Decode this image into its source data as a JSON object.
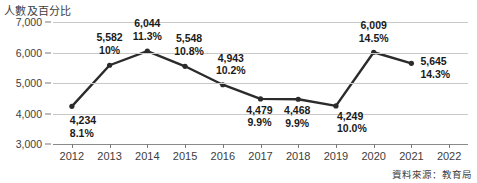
{
  "chart_data": {
    "type": "line",
    "title": "人數及百分比",
    "xlabel": "",
    "ylabel": "",
    "ylim": [
      3000,
      7000
    ],
    "y_step": 1000,
    "grid": true,
    "legend": null,
    "source_note": "資料來源：教育局",
    "line_color": "#2b2b2b",
    "grid_color": "#c9c9c9",
    "axis_color": "#8a8a8a",
    "text_color": "#3d3d3d",
    "categories": [
      "2012",
      "2013",
      "2014",
      "2015",
      "2016",
      "2017",
      "2018",
      "2019",
      "2020",
      "2021",
      "2022"
    ],
    "y_ticks": [
      "7,000",
      "6,000",
      "5,000",
      "4,000",
      "3,000"
    ],
    "y_tick_values": [
      7000,
      6000,
      5000,
      4000,
      3000
    ],
    "series": [
      {
        "name": "人數",
        "values": [
          4234,
          5582,
          6044,
          5548,
          4943,
          4479,
          4468,
          4249,
          6009,
          5645,
          null
        ]
      },
      {
        "name": "百分比",
        "values": [
          8.1,
          10,
          11.3,
          10.8,
          10.2,
          9.9,
          9.9,
          10.0,
          14.5,
          14.3,
          null
        ]
      }
    ],
    "point_labels": [
      {
        "year": "2012",
        "value": "4,234",
        "pct": "8.1%"
      },
      {
        "year": "2013",
        "value": "5,582",
        "pct": "10%"
      },
      {
        "year": "2014",
        "value": "6,044",
        "pct": "11.3%"
      },
      {
        "year": "2015",
        "value": "5,548",
        "pct": "10.8%"
      },
      {
        "year": "2016",
        "value": "4,943",
        "pct": "10.2%"
      },
      {
        "year": "2017",
        "value": "4,479",
        "pct": "9.9%"
      },
      {
        "year": "2018",
        "value": "4,468",
        "pct": "9.9%"
      },
      {
        "year": "2019",
        "value": "4,249",
        "pct": "10.0%"
      },
      {
        "year": "2020",
        "value": "6,009",
        "pct": "14.5%"
      },
      {
        "year": "2021",
        "value": "5,645",
        "pct": "14.3%"
      }
    ]
  }
}
